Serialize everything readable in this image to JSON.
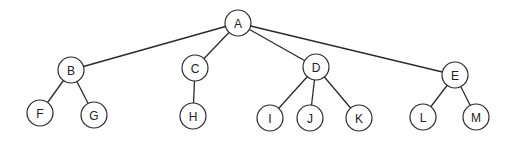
{
  "diagram": {
    "type": "tree",
    "root": "A",
    "nodes": [
      {
        "id": "A",
        "label": "A"
      },
      {
        "id": "B",
        "label": "B"
      },
      {
        "id": "C",
        "label": "C"
      },
      {
        "id": "D",
        "label": "D"
      },
      {
        "id": "E",
        "label": "E"
      },
      {
        "id": "F",
        "label": "F"
      },
      {
        "id": "G",
        "label": "G"
      },
      {
        "id": "H",
        "label": "H"
      },
      {
        "id": "I",
        "label": "I"
      },
      {
        "id": "J",
        "label": "J"
      },
      {
        "id": "K",
        "label": "K"
      },
      {
        "id": "L",
        "label": "L"
      },
      {
        "id": "M",
        "label": "M"
      }
    ],
    "edges": [
      {
        "from": "A",
        "to": "B"
      },
      {
        "from": "A",
        "to": "C"
      },
      {
        "from": "A",
        "to": "D"
      },
      {
        "from": "A",
        "to": "E"
      },
      {
        "from": "B",
        "to": "F"
      },
      {
        "from": "B",
        "to": "G"
      },
      {
        "from": "C",
        "to": "H"
      },
      {
        "from": "D",
        "to": "I"
      },
      {
        "from": "D",
        "to": "J"
      },
      {
        "from": "D",
        "to": "K"
      },
      {
        "from": "E",
        "to": "L"
      },
      {
        "from": "E",
        "to": "M"
      }
    ]
  }
}
